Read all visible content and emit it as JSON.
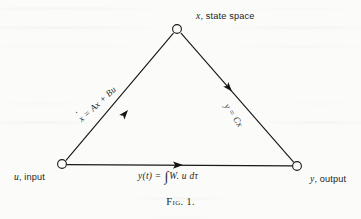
{
  "figure": {
    "caption_prefix": "Fig.",
    "caption_number": "1.",
    "nodes": {
      "state_space": {
        "symbol": "x",
        "text": ", state space"
      },
      "input": {
        "symbol": "u",
        "text": ", input"
      },
      "output": {
        "symbol": "y",
        "text": ", output"
      }
    },
    "edges": {
      "state_equation": {
        "lhs": "x",
        "rhs": " = Ax + Bu",
        "dotted": true
      },
      "output_equation": {
        "lhs": "y",
        "rhs": " = Cx",
        "dotted": false
      },
      "transfer_equation": {
        "lhs": "y(t) = ",
        "integrand": "W. u dτ"
      }
    },
    "geometry": {
      "apex_x": 177,
      "apex_y": 29,
      "left_x": 62,
      "left_y": 164,
      "right_x": 297,
      "right_y": 166,
      "node_radius": 4.4
    },
    "colors": {
      "ink": "#232323",
      "paper": "#fbfbfa",
      "line": "#1a1a1a"
    }
  }
}
